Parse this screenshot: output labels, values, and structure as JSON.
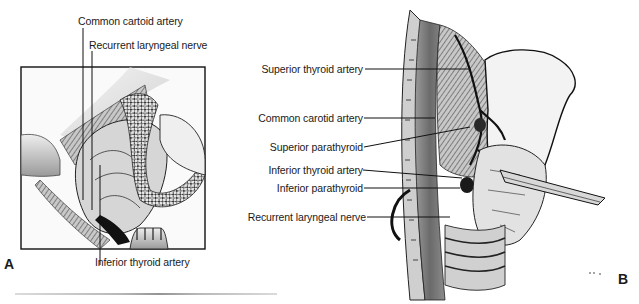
{
  "figure": {
    "panel_a": {
      "letter": "A",
      "labels": {
        "common_carotid": "Common cartoid artery",
        "recurrent_laryngeal": "Recurrent laryngeal nerve",
        "inferior_thyroid": "Inferior thyroid artery"
      }
    },
    "panel_b": {
      "letter": "B",
      "labels": {
        "superior_thyroid_artery": "Superior thyroid artery",
        "common_carotid_artery": "Common carotid artery",
        "superior_parathyroid": "Superior parathyroid",
        "inferior_thyroid_artery": "Inferior thyroid artery",
        "inferior_parathyroid": "Inferior parathyroid",
        "recurrent_laryngeal_nerve": "Recurrent laryngeal nerve"
      }
    }
  }
}
